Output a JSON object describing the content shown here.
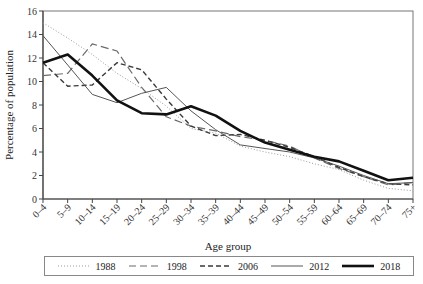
{
  "chart_data": {
    "type": "line",
    "title": "",
    "xlabel": "Age group",
    "ylabel": "Percentage of population",
    "ylim": [
      0,
      16
    ],
    "yticks": [
      0,
      2,
      4,
      6,
      8,
      10,
      12,
      14,
      16
    ],
    "grid": false,
    "legend_position": "bottom",
    "categories": [
      "0–4",
      "5–9",
      "10–14",
      "15–19",
      "20–24",
      "25–29",
      "30–34",
      "35–39",
      "40–44",
      "45–49",
      "50–54",
      "55–59",
      "60–64",
      "65–69",
      "70–74",
      "75+"
    ],
    "series": [
      {
        "name": "1988",
        "style": "dotted",
        "color": "#9a9a9a",
        "width": 1,
        "values": [
          15.0,
          13.7,
          12.3,
          10.7,
          9.4,
          7.9,
          6.0,
          5.6,
          4.5,
          4.0,
          3.6,
          3.0,
          2.5,
          1.6,
          0.9,
          0.7
        ]
      },
      {
        "name": "1998",
        "style": "long-dash",
        "color": "#6a6a6a",
        "width": 1.2,
        "values": [
          10.5,
          10.7,
          13.2,
          12.6,
          9.5,
          7.0,
          6.2,
          5.8,
          5.3,
          5.0,
          4.5,
          3.5,
          2.6,
          1.9,
          1.2,
          1.4
        ]
      },
      {
        "name": "2006",
        "style": "short-dash",
        "color": "#3a3a3a",
        "width": 1.4,
        "values": [
          11.6,
          9.6,
          9.7,
          11.6,
          11.0,
          8.5,
          6.2,
          5.4,
          5.5,
          5.0,
          4.4,
          3.6,
          2.7,
          1.9,
          1.3,
          1.2
        ]
      },
      {
        "name": "2012",
        "style": "solid",
        "color": "#555555",
        "width": 1,
        "values": [
          13.9,
          11.4,
          8.9,
          8.2,
          9.0,
          9.5,
          7.5,
          5.9,
          4.6,
          4.3,
          4.0,
          3.5,
          2.8,
          2.0,
          1.3,
          1.4
        ]
      },
      {
        "name": "2018",
        "style": "solid-thick",
        "color": "#111111",
        "width": 2.6,
        "values": [
          11.6,
          12.3,
          10.5,
          8.4,
          7.3,
          7.2,
          7.9,
          7.1,
          5.8,
          4.8,
          4.2,
          3.6,
          3.2,
          2.4,
          1.6,
          1.8
        ]
      }
    ]
  },
  "legend": {
    "items": [
      {
        "label": "1988"
      },
      {
        "label": "1998"
      },
      {
        "label": "2006"
      },
      {
        "label": "2012"
      },
      {
        "label": "2018"
      }
    ]
  }
}
